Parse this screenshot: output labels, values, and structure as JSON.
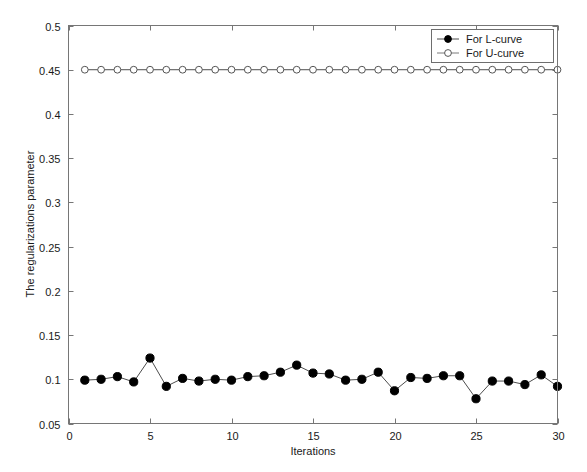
{
  "chart_data": {
    "type": "line",
    "title": "",
    "xlabel": "Iterations",
    "ylabel": "The regularizations parameter",
    "xlim": [
      0,
      30
    ],
    "ylim": [
      0.05,
      0.5
    ],
    "xticks": [
      0,
      5,
      10,
      15,
      20,
      25,
      30
    ],
    "xtick_labels": [
      "0",
      "5",
      "10",
      "15",
      "20",
      "25",
      "30"
    ],
    "yticks": [
      0.05,
      0.1,
      0.15,
      0.2,
      0.25,
      0.3,
      0.35,
      0.4,
      0.45,
      0.5
    ],
    "ytick_labels": [
      "0.05",
      "0.1",
      "0.15",
      "0.2",
      "0.25",
      "0.3",
      "0.35",
      "0.4",
      "0.45",
      "0.5"
    ],
    "grid": false,
    "legend_position": "top-right",
    "x": [
      1,
      2,
      3,
      4,
      5,
      6,
      7,
      8,
      9,
      10,
      11,
      12,
      13,
      14,
      15,
      16,
      17,
      18,
      19,
      20,
      21,
      22,
      23,
      24,
      25,
      26,
      27,
      28,
      29,
      30
    ],
    "series": [
      {
        "name": "For L-curve",
        "marker": "filled-circle",
        "color": "#000000",
        "values": [
          0.099,
          0.1,
          0.103,
          0.097,
          0.124,
          0.092,
          0.101,
          0.098,
          0.1,
          0.099,
          0.103,
          0.104,
          0.108,
          0.116,
          0.107,
          0.106,
          0.099,
          0.1,
          0.108,
          0.087,
          0.102,
          0.101,
          0.104,
          0.104,
          0.078,
          0.098,
          0.098,
          0.094,
          0.105,
          0.092
        ]
      },
      {
        "name": "For U-curve",
        "marker": "open-circle",
        "color": "#555555",
        "values": [
          0.45,
          0.45,
          0.45,
          0.45,
          0.45,
          0.45,
          0.45,
          0.45,
          0.45,
          0.45,
          0.45,
          0.45,
          0.45,
          0.45,
          0.45,
          0.45,
          0.45,
          0.45,
          0.45,
          0.45,
          0.45,
          0.45,
          0.45,
          0.45,
          0.45,
          0.45,
          0.45,
          0.45,
          0.45,
          0.45
        ]
      }
    ]
  },
  "legend": {
    "entries": [
      {
        "label": "For L-curve"
      },
      {
        "label": "For U-curve"
      }
    ]
  },
  "axes": {
    "x_title": "Iterations",
    "y_title": "The regularizations parameter"
  }
}
